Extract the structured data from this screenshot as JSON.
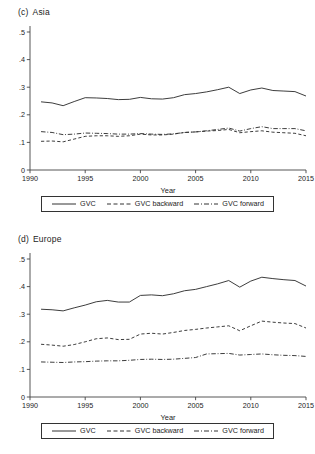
{
  "figure": {
    "background": "#ffffff",
    "line_color": "#333333"
  },
  "panels": [
    {
      "tag": "(c)",
      "name": "Asia",
      "xlabel": "Year",
      "legend": [
        {
          "label": "GVC",
          "style": "solid"
        },
        {
          "label": "GVC backward",
          "style": "dashed"
        },
        {
          "label": "GVC forward",
          "style": "dashdot"
        }
      ]
    },
    {
      "tag": "(d)",
      "name": "Europe",
      "xlabel": "Year",
      "legend": [
        {
          "label": "GVC",
          "style": "solid"
        },
        {
          "label": "GVC backward",
          "style": "dashed"
        },
        {
          "label": "GVC forward",
          "style": "dashdot"
        }
      ]
    }
  ],
  "chart_data": [
    {
      "type": "line",
      "title": "(c) Asia",
      "xlabel": "Year",
      "ylabel": "",
      "xlim": [
        1990,
        2015
      ],
      "ylim": [
        0,
        0.5
      ],
      "xticks": [
        1990,
        1995,
        2000,
        2005,
        2010,
        2015
      ],
      "xticklabels": [
        "1990",
        "1995",
        "2000",
        "2005",
        "2010",
        "2015"
      ],
      "yticks": [
        0,
        0.1,
        0.2,
        0.3,
        0.4,
        0.5
      ],
      "yticklabels": [
        "0",
        ".1",
        ".2",
        ".3",
        ".4",
        ".5"
      ],
      "grid": false,
      "legend_position": "below",
      "x": [
        1991,
        1992,
        1993,
        1994,
        1995,
        1996,
        1997,
        1998,
        1999,
        2000,
        2001,
        2002,
        2003,
        2004,
        2005,
        2006,
        2007,
        2008,
        2009,
        2010,
        2011,
        2012,
        2013,
        2014,
        2015
      ],
      "series": [
        {
          "name": "GVC",
          "style": "solid",
          "values": [
            0.247,
            0.243,
            0.233,
            0.248,
            0.262,
            0.261,
            0.259,
            0.255,
            0.256,
            0.263,
            0.258,
            0.257,
            0.262,
            0.273,
            0.277,
            0.283,
            0.291,
            0.3,
            0.277,
            0.29,
            0.297,
            0.288,
            0.286,
            0.284,
            0.268
          ]
        },
        {
          "name": "GVC backward",
          "style": "dashed",
          "values": [
            0.104,
            0.105,
            0.102,
            0.112,
            0.122,
            0.124,
            0.124,
            0.122,
            0.124,
            0.13,
            0.127,
            0.127,
            0.13,
            0.136,
            0.138,
            0.141,
            0.143,
            0.147,
            0.135,
            0.139,
            0.142,
            0.137,
            0.135,
            0.133,
            0.124
          ]
        },
        {
          "name": "GVC forward",
          "style": "dashdot",
          "values": [
            0.139,
            0.136,
            0.128,
            0.13,
            0.134,
            0.133,
            0.132,
            0.13,
            0.13,
            0.132,
            0.13,
            0.129,
            0.131,
            0.136,
            0.138,
            0.142,
            0.147,
            0.152,
            0.141,
            0.15,
            0.157,
            0.15,
            0.15,
            0.15,
            0.142
          ]
        }
      ]
    },
    {
      "type": "line",
      "title": "(d) Europe",
      "xlabel": "Year",
      "ylabel": "",
      "xlim": [
        1990,
        2015
      ],
      "ylim": [
        0,
        0.5
      ],
      "xticks": [
        1990,
        1995,
        2000,
        2005,
        2010,
        2015
      ],
      "xticklabels": [
        "1990",
        "1995",
        "2000",
        "2005",
        "2010",
        "2015"
      ],
      "yticks": [
        0,
        0.1,
        0.2,
        0.3,
        0.4,
        0.5
      ],
      "yticklabels": [
        "0",
        ".1",
        ".2",
        ".3",
        ".4",
        ".5"
      ],
      "grid": false,
      "legend_position": "below",
      "x": [
        1991,
        1992,
        1993,
        1994,
        1995,
        1996,
        1997,
        1998,
        1999,
        2000,
        2001,
        2002,
        2003,
        2004,
        2005,
        2006,
        2007,
        2008,
        2009,
        2010,
        2011,
        2012,
        2013,
        2014,
        2015
      ],
      "series": [
        {
          "name": "GVC",
          "style": "solid",
          "values": [
            0.318,
            0.316,
            0.312,
            0.323,
            0.333,
            0.345,
            0.35,
            0.344,
            0.344,
            0.368,
            0.37,
            0.367,
            0.374,
            0.385,
            0.39,
            0.4,
            0.41,
            0.422,
            0.398,
            0.42,
            0.434,
            0.429,
            0.425,
            0.422,
            0.402
          ]
        },
        {
          "name": "GVC backward",
          "style": "dashed",
          "values": [
            0.191,
            0.188,
            0.184,
            0.19,
            0.2,
            0.211,
            0.214,
            0.208,
            0.209,
            0.228,
            0.231,
            0.228,
            0.234,
            0.241,
            0.245,
            0.25,
            0.254,
            0.258,
            0.24,
            0.258,
            0.275,
            0.271,
            0.268,
            0.266,
            0.25
          ]
        },
        {
          "name": "GVC forward",
          "style": "dashdot",
          "values": [
            0.127,
            0.126,
            0.125,
            0.127,
            0.128,
            0.13,
            0.131,
            0.131,
            0.133,
            0.136,
            0.137,
            0.136,
            0.137,
            0.14,
            0.143,
            0.156,
            0.157,
            0.158,
            0.152,
            0.154,
            0.156,
            0.153,
            0.151,
            0.15,
            0.147
          ]
        }
      ]
    }
  ]
}
